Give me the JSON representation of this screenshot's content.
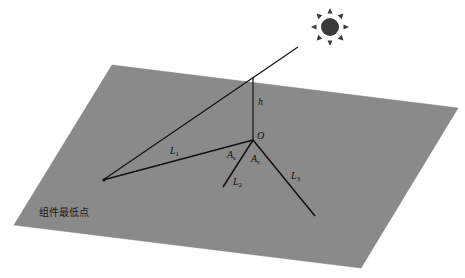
{
  "diagram": {
    "type": "geometry-illustration",
    "colors": {
      "background": "#ffffff",
      "plane": "#8a8a8a",
      "lines": "#111111",
      "sun": "#3a3a3a"
    },
    "plane_corners": [
      [
        112,
        65
      ],
      [
        458,
        108
      ],
      [
        361,
        268
      ],
      [
        14,
        225
      ]
    ],
    "sun": {
      "icon": "sun-icon",
      "cx": 330,
      "cy": 27
    },
    "labels": {
      "h": "h",
      "O": "O",
      "L1": {
        "base": "L",
        "sub": "1"
      },
      "L2": {
        "base": "L",
        "sub": "2"
      },
      "L3": {
        "base": "L",
        "sub": "3"
      },
      "A_left": {
        "base": "A",
        "sub": "s"
      },
      "A_right": {
        "base": "A",
        "sub": "s"
      },
      "lowest_point": "组件最低点"
    },
    "segments": {
      "sun_ray": [
        [
          298,
          47
        ],
        [
          103,
          180
        ]
      ],
      "pole_h": [
        [
          253,
          77
        ],
        [
          253,
          140
        ]
      ],
      "L1": [
        [
          253,
          140
        ],
        [
          103,
          180
        ]
      ],
      "L2": [
        [
          253,
          140
        ],
        [
          223,
          187
        ]
      ],
      "L3": [
        [
          253,
          140
        ],
        [
          315,
          216
        ]
      ]
    }
  }
}
